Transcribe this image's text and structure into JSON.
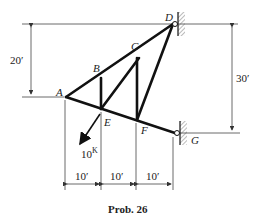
{
  "diagram": {
    "caption": "Prob. 26",
    "nodes": {
      "A": {
        "label": "A"
      },
      "B": {
        "label": "B"
      },
      "C": {
        "label": "C"
      },
      "D": {
        "label": "D"
      },
      "E": {
        "label": "E"
      },
      "F": {
        "label": "F"
      },
      "G": {
        "label": "G"
      }
    },
    "members": [
      "A-B",
      "B-C",
      "C-D",
      "A-E",
      "E-F",
      "F-G",
      "B-E",
      "E-C",
      "C-F",
      "F-D"
    ],
    "supports": [
      "D: pin to wall",
      "G: pin to wall"
    ],
    "load": {
      "label": "10",
      "unit": "K",
      "node": "E"
    },
    "dimensions": {
      "left_height": "20′",
      "right_height": "30′",
      "span_1": "10′",
      "span_2": "10′",
      "span_3": "10′"
    },
    "colors": {
      "line": "#111111",
      "dim_line": "#444444"
    }
  }
}
